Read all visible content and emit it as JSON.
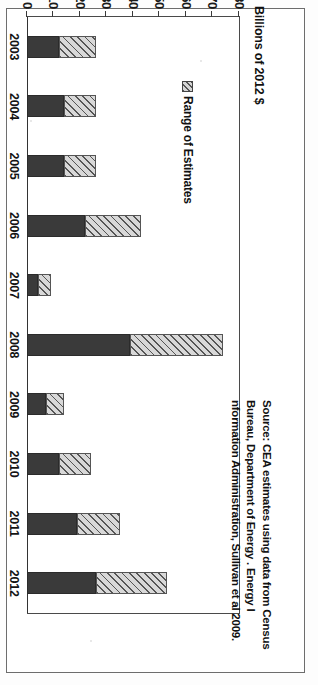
{
  "figure": {
    "axis_title": "Billions of 2012 $",
    "legend": {
      "swatch_name": "hatched-range-swatch",
      "label": "Range of Estimates"
    },
    "source_note": "Source: CEA estimates using data from Census Bureau, Department of Energy . Energy I nformation Administration, Sullivan et al 2009."
  },
  "chart_data": {
    "type": "bar",
    "orientation": "horizontal-bars-rotated",
    "title": "",
    "xlabel": "",
    "ylabel": "Billions of 2012 $",
    "ylim": [
      0,
      80
    ],
    "ytick_labels": [
      "0",
      "10",
      "20",
      "30",
      "40",
      "50",
      "60",
      "70",
      "80"
    ],
    "yticks": [
      0,
      10,
      20,
      30,
      40,
      50,
      60,
      70,
      80
    ],
    "grid": false,
    "legend_position": "inside-upper-left",
    "categories": [
      "2003",
      "2004",
      "2005",
      "2006",
      "2007",
      "2008",
      "2009",
      "2010",
      "2011",
      "2012"
    ],
    "series": [
      {
        "name": "Low estimate",
        "style": "solid-dark",
        "color": "#3a3a3a",
        "values": [
          12,
          14,
          14,
          22,
          4,
          39,
          7,
          12,
          19,
          26
        ]
      },
      {
        "name": "Range of Estimates",
        "style": "hatched",
        "color": "#d8d8d8",
        "values": [
          26,
          26,
          26,
          43,
          9,
          74,
          14,
          24,
          35,
          53
        ]
      }
    ],
    "bars": [
      {
        "category": "2003",
        "low": 12,
        "high": 26
      },
      {
        "category": "2004",
        "low": 14,
        "high": 26
      },
      {
        "category": "2005",
        "low": 14,
        "high": 26
      },
      {
        "category": "2006",
        "low": 22,
        "high": 43
      },
      {
        "category": "2007",
        "low": 4,
        "high": 9
      },
      {
        "category": "2008",
        "low": 39,
        "high": 74
      },
      {
        "category": "2009",
        "low": 7,
        "high": 14
      },
      {
        "category": "2010",
        "low": 12,
        "high": 24
      },
      {
        "category": "2011",
        "low": 19,
        "high": 35
      },
      {
        "category": "2012",
        "low": 26,
        "high": 53
      }
    ]
  }
}
